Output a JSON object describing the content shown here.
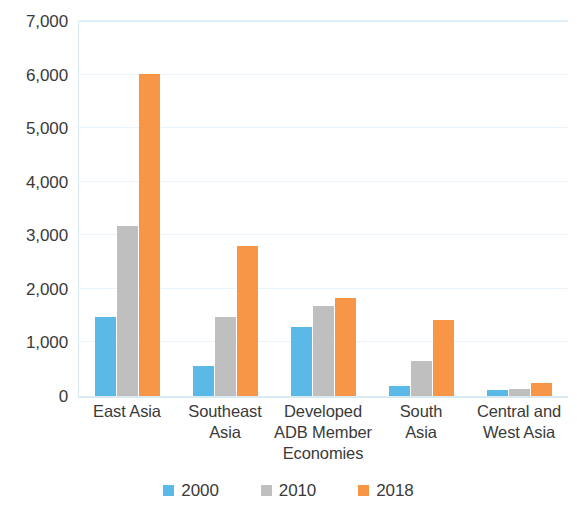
{
  "chart_data": {
    "type": "bar",
    "title": "",
    "subtitle": "",
    "xlabel": "",
    "ylabel": "",
    "categories": [
      "East Asia",
      "Southeast\nAsia",
      "Developed\nADB Member\nEconomies",
      "South\nAsia",
      "Central and\nWest Asia"
    ],
    "series": [
      {
        "name": "2000",
        "color": "#5bb9e8",
        "values": [
          1480,
          560,
          1290,
          190,
          110
        ]
      },
      {
        "name": "2010",
        "color": "#bfbfbf",
        "values": [
          3170,
          1480,
          1680,
          650,
          130
        ]
      },
      {
        "name": "2018",
        "color": "#f79646",
        "values": [
          6010,
          2800,
          1830,
          1410,
          240
        ]
      }
    ],
    "ylim": [
      0,
      7000
    ],
    "ytick_step": 1000,
    "ytick_labels": [
      "7,000",
      "6,000",
      "5,000",
      "4,000",
      "3,000",
      "2,000",
      "1,000",
      "0"
    ],
    "ytick_values": [
      7000,
      6000,
      5000,
      4000,
      3000,
      2000,
      1000,
      0
    ],
    "grid": true,
    "grid_axis": "y",
    "legend_position": "bottom",
    "bar_group_mode": "grouped"
  },
  "colors": {
    "series_2000": "#5bb9e8",
    "series_2010": "#bfbfbf",
    "series_2018": "#f79646",
    "gridline": "#e8f4f9",
    "axis_line": "#d9ecf4",
    "text": "#3a3a3a",
    "background": "#ffffff"
  }
}
